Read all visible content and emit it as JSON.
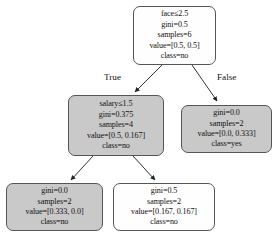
{
  "diagram": {
    "type": "decision-tree",
    "title": "",
    "colors": {
      "leaf_white": "#fefefe",
      "leaf_gray": "#c9c9c9",
      "border": "#555555",
      "text": "#111111",
      "background": "#ffffff"
    },
    "edge_labels": {
      "true": "True",
      "false": "False"
    },
    "nodes": [
      {
        "id": "root",
        "fill": "white",
        "lines": [
          "face≤2.5",
          "gini=0.5",
          "samples=6",
          "value=[0.5, 0.5]",
          "class=no"
        ],
        "feature": "face",
        "threshold": 2.5,
        "gini": 0.5,
        "samples": 6,
        "value": [
          0.5,
          0.5
        ],
        "class": "no"
      },
      {
        "id": "left",
        "fill": "gray",
        "lines": [
          "salary≤1.5",
          "gini=0.375",
          "samples=4",
          "value=[0.5, 0.167]",
          "class=no"
        ],
        "feature": "salary",
        "threshold": 1.5,
        "gini": 0.375,
        "samples": 4,
        "value": [
          0.5,
          0.167
        ],
        "class": "no"
      },
      {
        "id": "right",
        "fill": "gray",
        "lines": [
          "gini=0.0",
          "samples=2",
          "value=[0.0, 0.333]",
          "class=yes"
        ],
        "gini": 0.0,
        "samples": 2,
        "value": [
          0.0,
          0.333
        ],
        "class": "yes"
      },
      {
        "id": "leftleft",
        "fill": "gray",
        "lines": [
          "gini=0.0",
          "samples=2",
          "value=[0.333, 0.0]",
          "class=no"
        ],
        "gini": 0.0,
        "samples": 2,
        "value": [
          0.333,
          0.0
        ],
        "class": "no"
      },
      {
        "id": "leftright",
        "fill": "white",
        "lines": [
          "gini=0.5",
          "samples=2",
          "value=[0.167, 0.167]",
          "class=no"
        ],
        "gini": 0.5,
        "samples": 2,
        "value": [
          0.167,
          0.167
        ],
        "class": "no"
      }
    ]
  }
}
